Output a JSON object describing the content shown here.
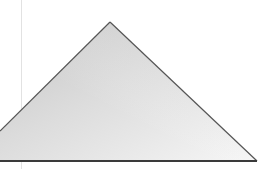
{
  "image": {
    "subject": "gray gradient triangle on white background",
    "shape": "triangle",
    "colors": {
      "background": "#ffffff",
      "fill_light": "#f4f4f4",
      "fill_dark": "#c8c8c8",
      "edge": "#555555",
      "baseline": "#3a3a3a",
      "guide_line": "#e2e2e2"
    },
    "geometry": {
      "apex": [
        110,
        22
      ],
      "left_point": [
        0,
        131
      ],
      "right_point": [
        257,
        161
      ],
      "baseline_y": 161,
      "guide_x": 21
    }
  }
}
